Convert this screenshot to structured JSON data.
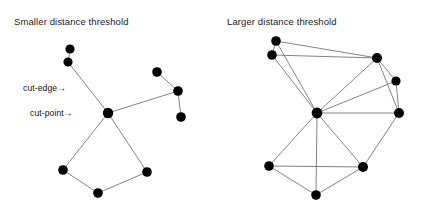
{
  "figure": {
    "width": 423,
    "height": 205,
    "background": "#ffffff",
    "edge_color": "#6d6d6d",
    "node_color": "#000000",
    "text_color": "#111111"
  },
  "panels": [
    {
      "id": "left-panel",
      "title": "Smaller distance threshold",
      "title_x": 14,
      "title_y": 25,
      "annotations": [
        {
          "id": "cut-edge",
          "text": "cut-edge→",
          "x": 23,
          "y": 91,
          "anchor": "start"
        },
        {
          "id": "cut-point",
          "text": "cut-point→",
          "x": 30,
          "y": 116,
          "anchor": "start"
        }
      ],
      "nodes": [
        {
          "id": "L0",
          "x": 70,
          "y": 49,
          "r": 4.6
        },
        {
          "id": "L1",
          "x": 68,
          "y": 62,
          "r": 4.6
        },
        {
          "id": "L2",
          "x": 108,
          "y": 113,
          "r": 5.2
        },
        {
          "id": "L3",
          "x": 63,
          "y": 170,
          "r": 4.8
        },
        {
          "id": "L4",
          "x": 98,
          "y": 193,
          "r": 4.8
        },
        {
          "id": "L5",
          "x": 147,
          "y": 172,
          "r": 4.8
        },
        {
          "id": "L6",
          "x": 157,
          "y": 72,
          "r": 4.8
        },
        {
          "id": "L7",
          "x": 178,
          "y": 91,
          "r": 4.8
        },
        {
          "id": "L8",
          "x": 181,
          "y": 117,
          "r": 4.8
        }
      ],
      "edges": [
        {
          "from": "L0",
          "to": "L1"
        },
        {
          "from": "L1",
          "to": "L2"
        },
        {
          "from": "L2",
          "to": "L3"
        },
        {
          "from": "L3",
          "to": "L4"
        },
        {
          "from": "L4",
          "to": "L5"
        },
        {
          "from": "L5",
          "to": "L2"
        },
        {
          "from": "L2",
          "to": "L7"
        },
        {
          "from": "L6",
          "to": "L7"
        },
        {
          "from": "L7",
          "to": "L8"
        }
      ]
    },
    {
      "id": "right-panel",
      "title": "Larger distance threshold",
      "title_x": 227,
      "title_y": 25,
      "annotations": [],
      "nodes": [
        {
          "id": "R0",
          "x": 276,
          "y": 41,
          "r": 4.8
        },
        {
          "id": "R1",
          "x": 272,
          "y": 55,
          "r": 4.8
        },
        {
          "id": "R2",
          "x": 377,
          "y": 58,
          "r": 5.0
        },
        {
          "id": "R3",
          "x": 396,
          "y": 81,
          "r": 4.6
        },
        {
          "id": "R4",
          "x": 399,
          "y": 113,
          "r": 5.0
        },
        {
          "id": "R5",
          "x": 317,
          "y": 113,
          "r": 5.4
        },
        {
          "id": "R6",
          "x": 269,
          "y": 166,
          "r": 4.8
        },
        {
          "id": "R7",
          "x": 363,
          "y": 167,
          "r": 5.0
        },
        {
          "id": "R8",
          "x": 316,
          "y": 195,
          "r": 4.8
        }
      ],
      "edges": [
        {
          "from": "R0",
          "to": "R1"
        },
        {
          "from": "R0",
          "to": "R2"
        },
        {
          "from": "R1",
          "to": "R2"
        },
        {
          "from": "R0",
          "to": "R5"
        },
        {
          "from": "R1",
          "to": "R5"
        },
        {
          "from": "R2",
          "to": "R5"
        },
        {
          "from": "R2",
          "to": "R3"
        },
        {
          "from": "R2",
          "to": "R4"
        },
        {
          "from": "R3",
          "to": "R4"
        },
        {
          "from": "R3",
          "to": "R5"
        },
        {
          "from": "R4",
          "to": "R5"
        },
        {
          "from": "R4",
          "to": "R7"
        },
        {
          "from": "R5",
          "to": "R6"
        },
        {
          "from": "R5",
          "to": "R7"
        },
        {
          "from": "R5",
          "to": "R8"
        },
        {
          "from": "R6",
          "to": "R7"
        },
        {
          "from": "R6",
          "to": "R8"
        },
        {
          "from": "R7",
          "to": "R8"
        }
      ]
    }
  ],
  "chart_data": {
    "type": "diagram",
    "title": "",
    "panels": [
      {
        "label": "Smaller distance threshold",
        "node_count": 9,
        "edge_count": 9,
        "annotations": [
          "cut-edge→",
          "cut-point→"
        ]
      },
      {
        "label": "Larger distance threshold",
        "node_count": 9,
        "edge_count": 18,
        "annotations": []
      }
    ]
  }
}
